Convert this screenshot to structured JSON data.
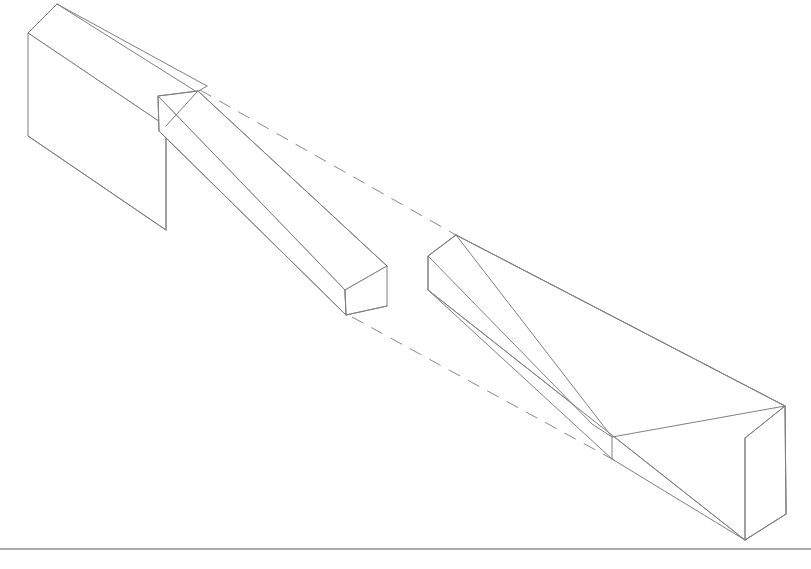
{
  "page": {
    "width": 811,
    "height": 569,
    "background_color": "#ffffff",
    "line_color": "#808080",
    "hidden_line_color": "#8a8a8a",
    "border_color": "#585858",
    "projection": "isometric"
  },
  "drawing": {
    "parts": [
      {
        "id": "left-beam",
        "name": "Left beam with tapered tenon",
        "features": [
          "rectangular prism body",
          "shoulder",
          "tapered tenon"
        ]
      },
      {
        "id": "right-beam",
        "name": "Right beam with tapered open mortise",
        "features": [
          "rectangular prism body",
          "open mortise slot",
          "mortise end wall"
        ]
      }
    ],
    "geometry": {
      "left_body": {
        "top_face": "57,4 28,33 166,126 197,92",
        "front_face": "28,33 28,136 166,230 166,126",
        "top_back_edge": "57,4 207,86",
        "back_right_edge": "197,92 207,86"
      },
      "left_body_outline": "57,4 28,33 28,136 166,230 166,126 197,92 57,4",
      "tenon": {
        "top_face": "158,96 198,91 387,266 345,290",
        "front_face": "345,290 346,315 387,306 387,266",
        "side_face": "158,96 345,290 346,315 159,131",
        "shoulder_vertical": "158,96 159,131",
        "end_vertical": "345,290 346,315"
      },
      "left_extra_edges": [
        "166,126 197,92",
        "158,96 198,91",
        "159,131 158,96"
      ],
      "right_body": {
        "top_back_edge": "456,235 785,406",
        "far_end_face": "785,406 745,438 745,540 786,514",
        "front_bottom_edge": "428,290 745,540",
        "left_end_face": "456,235 428,256 428,290"
      },
      "right_body_outline": "456,235 428,256 428,290 745,540 786,514 785,406 456,235",
      "mortise": {
        "inner_top_edge": "456,235 612,437",
        "inner_bottom_edge": "428,290 612,459",
        "end_wall_vertical": "612,437 612,459",
        "floor_front_edge": "612,459 745,540"
      },
      "hidden_lines": [
        {
          "id": "upper-alignment",
          "from": "200,90",
          "to": "456,235",
          "meaning": "tenon top corner to mortise top corner"
        },
        {
          "id": "lower-alignment",
          "from": "352,317",
          "to": "614,460",
          "meaning": "tenon bottom corner to mortise floor corner"
        }
      ],
      "border_rule": {
        "y": 549,
        "from_x": 0,
        "to_x": 811
      }
    }
  },
  "labels": {
    "left_part_label": "",
    "right_part_label": "",
    "caption": ""
  }
}
